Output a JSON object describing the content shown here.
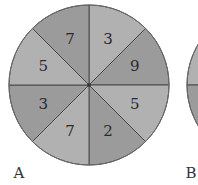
{
  "spinners": [
    {
      "label": "A",
      "sections": [
        {
          "value": "3",
          "shade": "light"
        },
        {
          "value": "9",
          "shade": "dark"
        },
        {
          "value": "5",
          "shade": "light"
        },
        {
          "value": "2",
          "shade": "dark"
        },
        {
          "value": "7",
          "shade": "light"
        },
        {
          "value": "3",
          "shade": "dark"
        },
        {
          "value": "5",
          "shade": "light"
        },
        {
          "value": "7",
          "shade": "dark"
        }
      ]
    },
    {
      "label": "B",
      "sections": []
    }
  ],
  "colors": {
    "light": "#b1b1b1",
    "dark": "#9b9b9b",
    "line": "#4a4a4a",
    "outline": "#6a6a6a"
  }
}
